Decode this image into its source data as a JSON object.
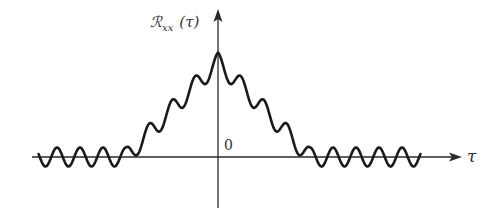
{
  "figure": {
    "y_axis_label": "ℛ",
    "y_axis_subscript": "xx",
    "y_axis_arg": "(τ)",
    "x_axis_label": "τ",
    "origin_label": "0"
  },
  "chart_data": {
    "type": "line",
    "title": "",
    "xlabel": "τ",
    "ylabel": "ℛxx(τ)",
    "components": [
      {
        "name": "triangle",
        "center": 0,
        "half_width": 4,
        "peak": 1.0
      },
      {
        "name": "sinusoid",
        "amplitude": 0.1,
        "period": 1,
        "phase_peak_at_zero": true
      }
    ],
    "x_range": [
      -7.8,
      8.8
    ],
    "grid": false,
    "legend": null
  }
}
